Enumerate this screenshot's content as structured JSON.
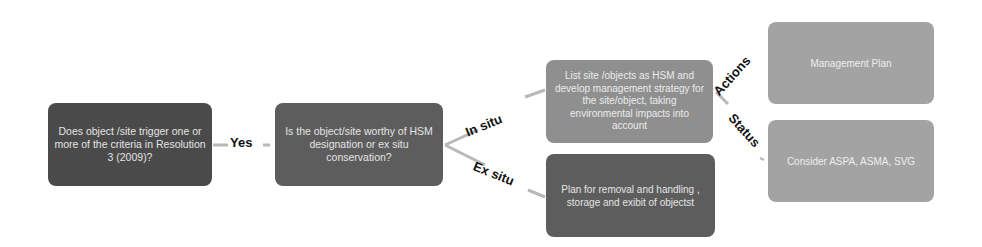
{
  "diagram": {
    "type": "flowchart",
    "nodes": [
      {
        "id": "q1",
        "text": "Does object /site trigger one or more of the criteria in Resolution 3 (2009)?"
      },
      {
        "id": "q2",
        "text": "Is the object/site worthy of HSM designation or ex situ conservation?"
      },
      {
        "id": "insitu",
        "text": "List site /objects as HSM and develop management strategy for the site/object, taking environmental impacts into account"
      },
      {
        "id": "exsitu",
        "text": "Plan for removal  and handling , storage and exibit of objectst"
      },
      {
        "id": "mgmt",
        "text": "Management Plan"
      },
      {
        "id": "consider",
        "text": "Consider ASPA, ASMA, SVG"
      }
    ],
    "edges": [
      {
        "from": "q1",
        "to": "q2",
        "label": "Yes"
      },
      {
        "from": "q2",
        "to": "insitu",
        "label": "In situ"
      },
      {
        "from": "q2",
        "to": "exsitu",
        "label": "Ex situ"
      },
      {
        "from": "insitu",
        "to": "mgmt",
        "label": "Actions"
      },
      {
        "from": "insitu",
        "to": "consider",
        "label": "Status"
      }
    ]
  },
  "colors": {
    "dark": "#4a4a4a",
    "mid": "#5d5d5d",
    "light": "#8f8f8f",
    "lighter": "#a3a3a3",
    "connector": "#b8b8b8"
  }
}
